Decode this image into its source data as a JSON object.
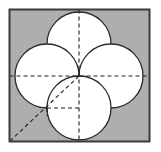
{
  "figure": {
    "canvas": {
      "width": 161,
      "height": 152,
      "background": "#ffffff"
    },
    "square": {
      "label": "shaded-square",
      "x": 9.5,
      "y": 9.5,
      "width": 140,
      "height": 132,
      "fill": "#aeaeae",
      "stroke": "#3c3c3c",
      "stroke_width": 1.6
    },
    "center": {
      "x": 79,
      "y": 76
    },
    "circles": [
      {
        "label": "top-circle",
        "cx": 79,
        "cy": 44,
        "r": 32,
        "fill": "#ffffff",
        "stroke": "#2b2b2b",
        "stroke_width": 1.3
      },
      {
        "label": "left-circle",
        "cx": 47,
        "cy": 76,
        "r": 32,
        "fill": "#ffffff",
        "stroke": "#2b2b2b",
        "stroke_width": 1.3
      },
      {
        "label": "right-circle",
        "cx": 111,
        "cy": 76,
        "r": 32,
        "fill": "#ffffff",
        "stroke": "#2b2b2b",
        "stroke_width": 1.3
      },
      {
        "label": "bottom-circle",
        "cx": 79,
        "cy": 108,
        "r": 32,
        "fill": "#ffffff",
        "stroke": "#2b2b2b",
        "stroke_width": 1.3
      }
    ],
    "dashed_lines": [
      {
        "label": "horizontal-axis",
        "x1": 9.5,
        "y1": 76,
        "x2": 149.5,
        "y2": 76
      },
      {
        "label": "vertical-axis",
        "x1": 79,
        "y1": 9.5,
        "x2": 79,
        "y2": 141.5
      },
      {
        "label": "diagonal-to-corner",
        "x1": 79,
        "y1": 76,
        "x2": 10.5,
        "y2": 140.5
      },
      {
        "label": "quadrant-horizontal-chord",
        "x1": 47,
        "y1": 108,
        "x2": 79,
        "y2": 108
      },
      {
        "label": "quadrant-vertical-chord",
        "x1": 47,
        "y1": 108,
        "x2": 47,
        "y2": 116
      }
    ],
    "dash_style": {
      "pattern": "4 3",
      "stroke": "#1e1e1e",
      "stroke_width": 1.1
    }
  }
}
